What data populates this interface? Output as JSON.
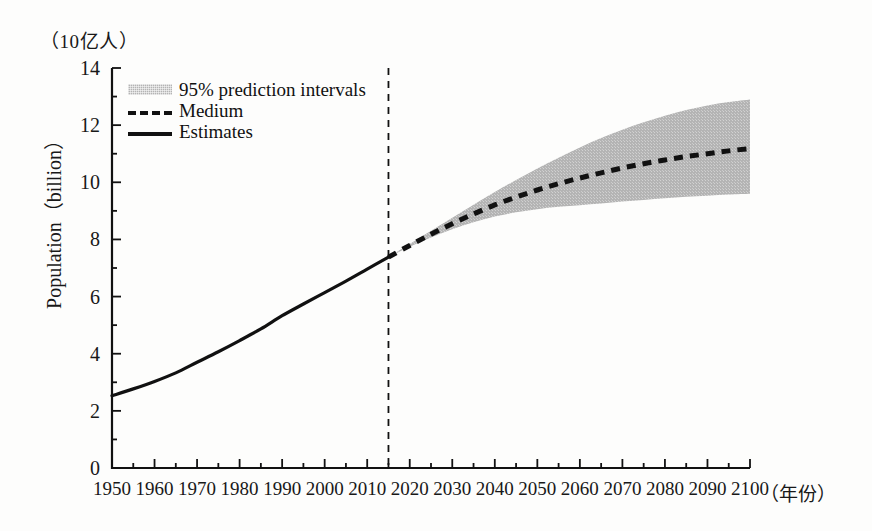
{
  "axes": {
    "y_unit_label": "（10亿人）",
    "x_unit_label": "（年份）",
    "y_title": "Population（billion）"
  },
  "legend": {
    "items": [
      {
        "label": "95% prediction intervals",
        "style": "band",
        "color": "#b4b4b4"
      },
      {
        "label": "Medium",
        "style": "dashed",
        "color": "#111111"
      },
      {
        "label": "Estimates",
        "style": "solid",
        "color": "#111111"
      }
    ]
  },
  "chart_data": {
    "type": "line",
    "title": "",
    "subtitle": "",
    "xlabel": "（年份）",
    "ylabel": "Population（billion）",
    "xlim": [
      1950,
      2100
    ],
    "ylim": [
      0,
      14
    ],
    "grid": false,
    "legend_position": "inside-top-left",
    "x_major_ticks": [
      1950,
      1960,
      1970,
      1980,
      1990,
      2000,
      2010,
      2020,
      2030,
      2040,
      2050,
      2060,
      2070,
      2080,
      2090,
      2100
    ],
    "x_minor_tick_step": 5,
    "y_major_ticks": [
      0,
      2,
      4,
      6,
      8,
      10,
      12,
      14
    ],
    "y_minor_tick_step": 1,
    "annotations": [
      {
        "type": "vline",
        "x": 2015,
        "style": "dashed",
        "label": "estimates / projection divide"
      }
    ],
    "series": [
      {
        "name": "Estimates",
        "style": "solid",
        "color": "#111111",
        "x": [
          1950,
          1955,
          1960,
          1965,
          1970,
          1975,
          1980,
          1985,
          1990,
          1995,
          2000,
          2005,
          2010,
          2015
        ],
        "values": [
          2.53,
          2.77,
          3.03,
          3.33,
          3.7,
          4.07,
          4.46,
          4.87,
          5.33,
          5.74,
          6.14,
          6.54,
          6.96,
          7.38
        ]
      },
      {
        "name": "Medium",
        "style": "dashed",
        "color": "#111111",
        "x": [
          2015,
          2020,
          2025,
          2030,
          2035,
          2040,
          2045,
          2050,
          2055,
          2060,
          2065,
          2070,
          2075,
          2080,
          2085,
          2090,
          2095,
          2100
        ],
        "values": [
          7.38,
          7.79,
          8.18,
          8.55,
          8.89,
          9.21,
          9.48,
          9.73,
          9.95,
          10.15,
          10.33,
          10.5,
          10.65,
          10.78,
          10.9,
          11.0,
          11.1,
          11.18
        ]
      }
    ],
    "bands": [
      {
        "name": "95% prediction intervals",
        "color": "#b4b4b4",
        "x": [
          2015,
          2020,
          2025,
          2030,
          2035,
          2040,
          2045,
          2050,
          2055,
          2060,
          2065,
          2070,
          2075,
          2080,
          2085,
          2090,
          2095,
          2100
        ],
        "lower": [
          7.38,
          7.74,
          8.07,
          8.36,
          8.6,
          8.8,
          8.95,
          9.06,
          9.14,
          9.2,
          9.26,
          9.33,
          9.38,
          9.44,
          9.49,
          9.53,
          9.57,
          9.6
        ],
        "upper": [
          7.38,
          7.84,
          8.3,
          8.76,
          9.21,
          9.66,
          10.08,
          10.48,
          10.86,
          11.22,
          11.55,
          11.84,
          12.1,
          12.33,
          12.53,
          12.69,
          12.81,
          12.9
        ]
      }
    ]
  }
}
